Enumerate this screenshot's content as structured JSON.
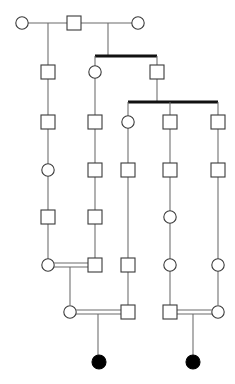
{
  "diagram": {
    "type": "pedigree",
    "width": 235,
    "height": 384,
    "background_color": "#ffffff",
    "line_color": "#6a6a6a",
    "symbol_stroke_color": "#3a3a3a",
    "sibship_bar_color": "#111111",
    "affected_fill_color": "#000000",
    "unaffected_fill_color": "#ffffff",
    "legend": {
      "square_meaning": "male",
      "circle_meaning": "female",
      "filled_meaning": "affected individual",
      "open_meaning": "unaffected individual",
      "double_line_meaning": "consanguineous mating"
    },
    "generation_rows_y": [
      23,
      72,
      122,
      170,
      217,
      265,
      312,
      362
    ],
    "column_x": [
      22,
      48,
      70,
      74,
      95,
      98,
      128,
      138,
      157,
      170,
      193,
      218
    ],
    "counts": {
      "total_individuals": 25,
      "males": 14,
      "females": 11,
      "affected": 2,
      "consanguineous_matings": 3
    },
    "symbols": [
      {
        "id": "g1-f1",
        "sex": "female",
        "shape": "circle",
        "affected": false,
        "cx": 22,
        "cy": 23,
        "r": 6.2,
        "generation": 1
      },
      {
        "id": "g1-m1",
        "sex": "male",
        "shape": "square",
        "affected": false,
        "cx": 74,
        "cy": 23,
        "size": 14,
        "generation": 1
      },
      {
        "id": "g1-f2",
        "sex": "female",
        "shape": "circle",
        "affected": false,
        "cx": 138,
        "cy": 23,
        "r": 6.2,
        "generation": 1
      },
      {
        "id": "g2-m1",
        "sex": "male",
        "shape": "square",
        "affected": false,
        "cx": 48,
        "cy": 72,
        "size": 14,
        "generation": 2
      },
      {
        "id": "g2-f1",
        "sex": "female",
        "shape": "circle",
        "affected": false,
        "cx": 95,
        "cy": 72,
        "r": 6.2,
        "generation": 2
      },
      {
        "id": "g2-m2",
        "sex": "male",
        "shape": "square",
        "affected": false,
        "cx": 157,
        "cy": 72,
        "size": 14,
        "generation": 2
      },
      {
        "id": "g3-m1",
        "sex": "male",
        "shape": "square",
        "affected": false,
        "cx": 48,
        "cy": 122,
        "size": 14,
        "generation": 3
      },
      {
        "id": "g3-m2",
        "sex": "male",
        "shape": "square",
        "affected": false,
        "cx": 95,
        "cy": 122,
        "size": 14,
        "generation": 3
      },
      {
        "id": "g3-f1",
        "sex": "female",
        "shape": "circle",
        "affected": false,
        "cx": 128,
        "cy": 122,
        "r": 6.2,
        "generation": 3
      },
      {
        "id": "g3-m3",
        "sex": "male",
        "shape": "square",
        "affected": false,
        "cx": 170,
        "cy": 122,
        "size": 14,
        "generation": 3
      },
      {
        "id": "g3-m4",
        "sex": "male",
        "shape": "square",
        "affected": false,
        "cx": 218,
        "cy": 122,
        "size": 14,
        "generation": 3
      },
      {
        "id": "g4-f1",
        "sex": "female",
        "shape": "circle",
        "affected": false,
        "cx": 48,
        "cy": 170,
        "r": 6.2,
        "generation": 4
      },
      {
        "id": "g4-m1",
        "sex": "male",
        "shape": "square",
        "affected": false,
        "cx": 95,
        "cy": 170,
        "size": 14,
        "generation": 4
      },
      {
        "id": "g4-m2",
        "sex": "male",
        "shape": "square",
        "affected": false,
        "cx": 128,
        "cy": 170,
        "size": 14,
        "generation": 4
      },
      {
        "id": "g4-m3",
        "sex": "male",
        "shape": "square",
        "affected": false,
        "cx": 170,
        "cy": 170,
        "size": 14,
        "generation": 4
      },
      {
        "id": "g4-m4",
        "sex": "male",
        "shape": "square",
        "affected": false,
        "cx": 218,
        "cy": 170,
        "size": 14,
        "generation": 4
      },
      {
        "id": "g5-m1",
        "sex": "male",
        "shape": "square",
        "affected": false,
        "cx": 48,
        "cy": 217,
        "size": 14,
        "generation": 5
      },
      {
        "id": "g5-m2",
        "sex": "male",
        "shape": "square",
        "affected": false,
        "cx": 95,
        "cy": 217,
        "size": 14,
        "generation": 5
      },
      {
        "id": "g5-f1",
        "sex": "female",
        "shape": "circle",
        "affected": false,
        "cx": 170,
        "cy": 217,
        "r": 6.2,
        "generation": 5
      },
      {
        "id": "g6-f1",
        "sex": "female",
        "shape": "circle",
        "affected": false,
        "cx": 48,
        "cy": 265,
        "r": 6.2,
        "generation": 6
      },
      {
        "id": "g6-m1",
        "sex": "male",
        "shape": "square",
        "affected": false,
        "cx": 95,
        "cy": 265,
        "size": 14,
        "generation": 6
      },
      {
        "id": "g6-m2",
        "sex": "male",
        "shape": "square",
        "affected": false,
        "cx": 128,
        "cy": 265,
        "size": 14,
        "generation": 6
      },
      {
        "id": "g6-f2",
        "sex": "female",
        "shape": "circle",
        "affected": false,
        "cx": 170,
        "cy": 265,
        "r": 6.2,
        "generation": 6
      },
      {
        "id": "g6-f3",
        "sex": "female",
        "shape": "circle",
        "affected": false,
        "cx": 218,
        "cy": 265,
        "r": 6.2,
        "generation": 6
      },
      {
        "id": "g7-f1",
        "sex": "female",
        "shape": "circle",
        "affected": false,
        "cx": 70,
        "cy": 312,
        "r": 6.2,
        "generation": 7
      },
      {
        "id": "g7-m1",
        "sex": "male",
        "shape": "square",
        "affected": false,
        "cx": 128,
        "cy": 312,
        "size": 14,
        "generation": 7
      },
      {
        "id": "g7-m2",
        "sex": "male",
        "shape": "square",
        "affected": false,
        "cx": 170,
        "cy": 312,
        "size": 14,
        "generation": 7
      },
      {
        "id": "g7-f2",
        "sex": "female",
        "shape": "circle",
        "affected": false,
        "cx": 218,
        "cy": 312,
        "r": 6.2,
        "generation": 7
      },
      {
        "id": "g8-f1",
        "sex": "female",
        "shape": "circle",
        "affected": true,
        "cx": 99,
        "cy": 362,
        "r": 7.0,
        "generation": 8
      },
      {
        "id": "g8-f2",
        "sex": "female",
        "shape": "circle",
        "affected": true,
        "cx": 193,
        "cy": 362,
        "r": 7.0,
        "generation": 8
      }
    ],
    "edges": [
      {
        "id": "mate-g1-a",
        "kind": "mating",
        "points": "28,23 67,23"
      },
      {
        "id": "mate-g1-b",
        "kind": "mating",
        "points": "81,23 132,23"
      },
      {
        "id": "drop-g1-a",
        "kind": "descent",
        "points": "48,23 48,65"
      },
      {
        "id": "drop-g1-b",
        "kind": "descent",
        "points": "108,23 108,56"
      },
      {
        "id": "sibbar-g2",
        "kind": "sibship-bar",
        "points": "95,56 157,56"
      },
      {
        "id": "sib-g2-a",
        "kind": "descent",
        "points": "95,56 95,66"
      },
      {
        "id": "sib-g2-b",
        "kind": "descent",
        "points": "157,56 157,65"
      },
      {
        "id": "line-48-g2-g3",
        "kind": "descent",
        "points": "48,79 48,115"
      },
      {
        "id": "line-95-g2-g3",
        "kind": "descent",
        "points": "95,78 95,115"
      },
      {
        "id": "drop-157-g2",
        "kind": "descent",
        "points": "157,79 157,102"
      },
      {
        "id": "sibbar-g3",
        "kind": "sibship-bar",
        "points": "128,102 218,102"
      },
      {
        "id": "sib-g3-a",
        "kind": "descent",
        "points": "128,102 128,116"
      },
      {
        "id": "sib-g3-b",
        "kind": "descent",
        "points": "170,102 170,115"
      },
      {
        "id": "sib-g3-c",
        "kind": "descent",
        "points": "218,102 218,115"
      },
      {
        "id": "line-48-g3-g4",
        "kind": "descent",
        "points": "48,129 48,164"
      },
      {
        "id": "line-95-g3-g4",
        "kind": "descent",
        "points": "95,129 95,163"
      },
      {
        "id": "line-128-g3-g4",
        "kind": "descent",
        "points": "128,128 128,163"
      },
      {
        "id": "line-170-g3-g4",
        "kind": "descent",
        "points": "170,129 170,163"
      },
      {
        "id": "line-218-g3-g4",
        "kind": "descent",
        "points": "218,129 218,163"
      },
      {
        "id": "line-48-g4-g5",
        "kind": "descent",
        "points": "48,176 48,210"
      },
      {
        "id": "line-95-g4-g5",
        "kind": "descent",
        "points": "95,177 95,210"
      },
      {
        "id": "line-128-g4-g6",
        "kind": "descent",
        "points": "128,177 128,258"
      },
      {
        "id": "line-170-g4-g5",
        "kind": "descent",
        "points": "170,177 170,211"
      },
      {
        "id": "line-218-g4-g6",
        "kind": "descent",
        "points": "218,177 218,259"
      },
      {
        "id": "line-48-g5-g6",
        "kind": "descent",
        "points": "48,224 48,259"
      },
      {
        "id": "line-95-g5-g6",
        "kind": "descent",
        "points": "95,224 95,258"
      },
      {
        "id": "line-170-g5-g6",
        "kind": "descent",
        "points": "170,223 170,259"
      },
      {
        "id": "consang-g6-upper",
        "kind": "mating-consanguineous",
        "points": "54,263 88,263"
      },
      {
        "id": "consang-g6-lower",
        "kind": "mating-consanguineous",
        "points": "54,267 88,267"
      },
      {
        "id": "drop-g6-couple",
        "kind": "descent",
        "points": "70,267 70,305"
      },
      {
        "id": "line-128-g6-g7",
        "kind": "descent",
        "points": "128,272 128,305"
      },
      {
        "id": "line-170-g6-g7",
        "kind": "descent",
        "points": "170,271 170,305"
      },
      {
        "id": "line-218-g6-g7",
        "kind": "descent",
        "points": "218,271 218,305"
      },
      {
        "id": "consang-g7a-upper",
        "kind": "mating-consanguineous",
        "points": "76,310 121,310"
      },
      {
        "id": "consang-g7a-lower",
        "kind": "mating-consanguineous",
        "points": "76,314 121,314"
      },
      {
        "id": "drop-g7a-child",
        "kind": "descent",
        "points": "98,314 98,355"
      },
      {
        "id": "consang-g7b-upper",
        "kind": "mating-consanguineous",
        "points": "177,310 212,310"
      },
      {
        "id": "consang-g7b-lower",
        "kind": "mating-consanguineous",
        "points": "177,314 212,314"
      },
      {
        "id": "drop-g7b-child",
        "kind": "descent",
        "points": "193,314 193,355"
      }
    ]
  }
}
